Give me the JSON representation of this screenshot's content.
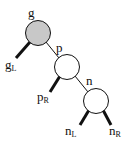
{
  "diagram": {
    "type": "binary-tree",
    "colors": {
      "highlight_fill": "#c8c8c8",
      "node_fill": "#ffffff",
      "stroke": "#111111"
    },
    "nodes": [
      {
        "id": "g",
        "label": "g",
        "highlighted": true
      },
      {
        "id": "p",
        "label": "p",
        "highlighted": false
      },
      {
        "id": "n",
        "label": "n",
        "highlighted": false
      }
    ],
    "subtrees": [
      {
        "id": "gL",
        "base": "g",
        "sub": "L"
      },
      {
        "id": "pR",
        "base": "p",
        "sub": "R"
      },
      {
        "id": "nL",
        "base": "n",
        "sub": "L"
      },
      {
        "id": "nR",
        "base": "n",
        "sub": "R"
      }
    ],
    "edges": [
      {
        "from": "g",
        "to": "p",
        "kind": "node"
      },
      {
        "from": "p",
        "to": "n",
        "kind": "node"
      },
      {
        "from": "g",
        "to": "gL",
        "kind": "subtree"
      },
      {
        "from": "p",
        "to": "pR",
        "kind": "subtree"
      },
      {
        "from": "n",
        "to": "nL",
        "kind": "subtree"
      },
      {
        "from": "n",
        "to": "nR",
        "kind": "subtree"
      }
    ]
  }
}
